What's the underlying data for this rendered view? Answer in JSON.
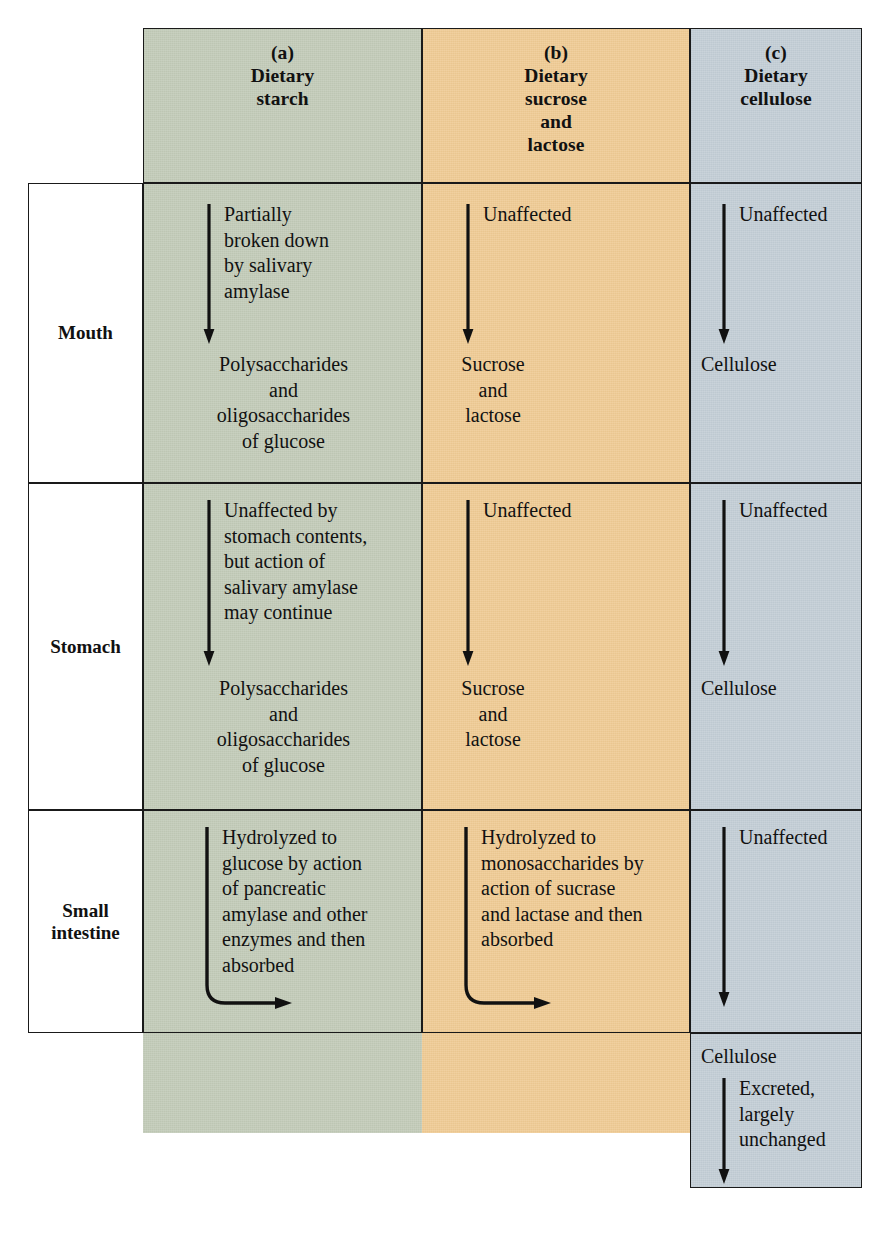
{
  "figure": {
    "type": "process-table",
    "colors": {
      "column_a_fill": "#c2cbb8",
      "column_b_fill": "#f0cb94",
      "column_c_fill": "#c3ced6",
      "rule": "#1a1a1a",
      "background": "#ffffff"
    },
    "columns": [
      {
        "key": "a",
        "tag": "(a)",
        "title": "Dietary\nstarch"
      },
      {
        "key": "b",
        "tag": "(b)",
        "title": "Dietary\nsucrose\nand\nlactose"
      },
      {
        "key": "c",
        "tag": "(c)",
        "title": "Dietary\ncellulose"
      }
    ],
    "rows": [
      {
        "key": "mouth",
        "label": "Mouth",
        "cells": {
          "a": {
            "process": "Partially\nbroken down\nby salivary\namylase",
            "product": "Polysaccharides\nand\noligosaccharides\nof glucose",
            "arrow": "down"
          },
          "b": {
            "process": "Unaffected",
            "product": "Sucrose\nand\nlactose",
            "arrow": "down"
          },
          "c": {
            "process": "Unaffected",
            "product": "Cellulose",
            "arrow": "down"
          }
        }
      },
      {
        "key": "stomach",
        "label": "Stomach",
        "cells": {
          "a": {
            "process": "Unaffected by\nstomach contents,\nbut action of\nsalivary amylase\nmay continue",
            "product": "Polysaccharides\nand\noligosaccharides\nof glucose",
            "arrow": "down"
          },
          "b": {
            "process": "Unaffected",
            "product": "Sucrose\nand\nlactose",
            "arrow": "down"
          },
          "c": {
            "process": "Unaffected",
            "product": "Cellulose",
            "arrow": "down"
          }
        }
      },
      {
        "key": "small-intestine",
        "label": "Small\nintestine",
        "cells": {
          "a": {
            "process": "Hydrolyzed to\nglucose by action\nof pancreatic\namylase and other\nenzymes and then\nabsorbed",
            "product": "",
            "arrow": "down-then-right"
          },
          "b": {
            "process": "Hydrolyzed to\nmonosaccharides by\naction of sucrase\nand lactase and then\nabsorbed",
            "product": "",
            "arrow": "down-then-right"
          },
          "c": {
            "process": "Unaffected",
            "product": "",
            "arrow": "down"
          }
        }
      },
      {
        "key": "excretion",
        "label": "",
        "cells": {
          "a": null,
          "b": null,
          "c": {
            "product": "Cellulose",
            "process": "Excreted,\nlargely\nunchanged",
            "arrow": "down"
          }
        }
      }
    ]
  }
}
